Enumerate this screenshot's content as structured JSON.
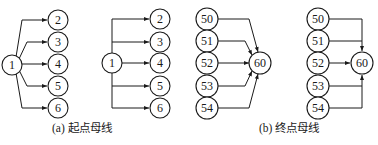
{
  "figures": [
    {
      "id": "a-curved",
      "source": {
        "label": "1"
      },
      "targets": [
        {
          "label": "2"
        },
        {
          "label": "3"
        },
        {
          "label": "4"
        },
        {
          "label": "5"
        },
        {
          "label": "6"
        }
      ]
    },
    {
      "id": "a-orthogonal",
      "source": {
        "label": "1"
      },
      "targets": [
        {
          "label": "2"
        },
        {
          "label": "3"
        },
        {
          "label": "4"
        },
        {
          "label": "5"
        },
        {
          "label": "6"
        }
      ]
    },
    {
      "id": "b-curved",
      "sources": [
        {
          "label": "50"
        },
        {
          "label": "51"
        },
        {
          "label": "52"
        },
        {
          "label": "53"
        },
        {
          "label": "54"
        }
      ],
      "target": {
        "label": "60"
      }
    },
    {
      "id": "b-orthogonal",
      "sources": [
        {
          "label": "50"
        },
        {
          "label": "51"
        },
        {
          "label": "52"
        },
        {
          "label": "53"
        },
        {
          "label": "54"
        }
      ],
      "target": {
        "label": "60"
      }
    }
  ],
  "captions": {
    "a": "(a) 起点母线",
    "b": "(b) 终点母线"
  },
  "colors": {
    "stroke": "#1a1a1a",
    "background": "#ffffff"
  }
}
